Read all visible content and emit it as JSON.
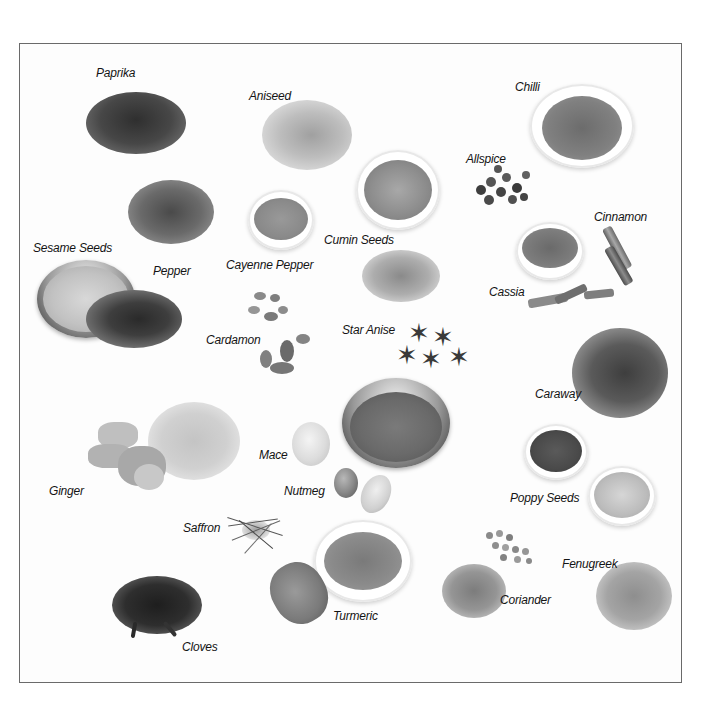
{
  "plate": {
    "frame_color": "#6a6a6a",
    "background": "#fdfdfd"
  },
  "spices": [
    {
      "id": "paprika",
      "label": "Paprika",
      "label_pos": [
        110,
        66
      ],
      "form": "powder-pile",
      "color": "#4a4a4a"
    },
    {
      "id": "aniseed",
      "label": "Aniseed",
      "label_pos": [
        249,
        92
      ],
      "form": "seed-pile",
      "color": "#bdbdbd"
    },
    {
      "id": "chilli",
      "label": "Chilli",
      "label_pos": [
        515,
        80
      ],
      "form": "powder-in-bowl",
      "color": "#7d7d7d"
    },
    {
      "id": "allspice",
      "label": "Allspice",
      "label_pos": [
        466,
        152
      ],
      "form": "berries",
      "color": "#4c4c4c"
    },
    {
      "id": "cinnamon",
      "label": "Cinnamon",
      "label_pos": [
        594,
        210
      ],
      "form": "sticks",
      "color": "#8a8a8a"
    },
    {
      "id": "cumin-seeds",
      "label": "Cumin Seeds",
      "label_pos": [
        324,
        233
      ],
      "form": "seeds-in-bowl",
      "color": "#8e8e8e"
    },
    {
      "id": "cayenne-pepper",
      "label": "Cayenne Pepper",
      "label_pos": [
        226,
        258
      ],
      "form": "powder-in-bowl",
      "color": "#8c8c8c"
    },
    {
      "id": "sesame-seeds",
      "label": "Sesame Seeds",
      "label_pos": [
        33,
        241
      ],
      "form": "seeds-in-steel-bowl",
      "color": "#c6c6c6"
    },
    {
      "id": "pepper",
      "label": "Pepper",
      "label_pos": [
        153,
        264
      ],
      "form": "peppercorns",
      "color": "#3a3a3a"
    },
    {
      "id": "cassia",
      "label": "Cassia",
      "label_pos": [
        489,
        285
      ],
      "form": "bark-and-bowl",
      "color": "#7a7a7a"
    },
    {
      "id": "cardamon",
      "label": "Cardamon",
      "label_pos": [
        206,
        333
      ],
      "form": "pods",
      "color": "#8a8a8a"
    },
    {
      "id": "star-anise",
      "label": "Star Anise",
      "label_pos": [
        342,
        323
      ],
      "form": "stars",
      "color": "#3e3e3e"
    },
    {
      "id": "caraway",
      "label": "Caraway",
      "label_pos": [
        535,
        387
      ],
      "form": "seed-pile",
      "color": "#5a5a5a"
    },
    {
      "id": "mace",
      "label": "Mace",
      "label_pos": [
        259,
        448
      ],
      "form": "blades",
      "color": "#d8d8d8"
    },
    {
      "id": "nutmeg",
      "label": "Nutmeg",
      "label_pos": [
        284,
        484
      ],
      "form": "nut",
      "color": "#8a8a8a"
    },
    {
      "id": "ginger",
      "label": "Ginger",
      "label_pos": [
        49,
        484
      ],
      "form": "root-and-powder",
      "color": "#bcbcbc"
    },
    {
      "id": "poppy-seeds",
      "label": "Poppy Seeds",
      "label_pos": [
        510,
        491
      ],
      "form": "seeds-in-bowls",
      "color": "#4e4e4e"
    },
    {
      "id": "saffron",
      "label": "Saffron",
      "label_pos": [
        183,
        521
      ],
      "form": "threads",
      "color": "#6a6a6a"
    },
    {
      "id": "fenugreek",
      "label": "Fenugreek",
      "label_pos": [
        562,
        557
      ],
      "form": "seed-pile",
      "color": "#a8a8a8"
    },
    {
      "id": "coriander",
      "label": "Coriander",
      "label_pos": [
        500,
        593
      ],
      "form": "seeds-and-powder",
      "color": "#9a9a9a"
    },
    {
      "id": "turmeric",
      "label": "Turmeric",
      "label_pos": [
        333,
        609
      ],
      "form": "root-and-powder-bowl",
      "color": "#8a8a8a"
    },
    {
      "id": "cloves",
      "label": "Cloves",
      "label_pos": [
        182,
        640
      ],
      "form": "cloves",
      "color": "#2a2a2a"
    }
  ]
}
